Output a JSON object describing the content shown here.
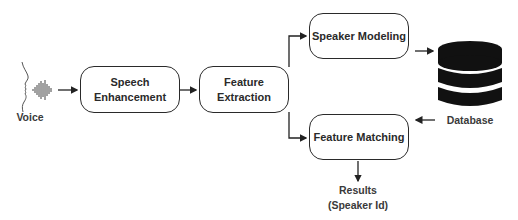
{
  "diagram": {
    "type": "flowchart",
    "title": "",
    "input": {
      "label": "Voice",
      "icon": "face-profile-voice-wave-icon"
    },
    "nodes": [
      {
        "id": "speech_enhancement",
        "label_line1": "Speech",
        "label_line2": "Enhancement"
      },
      {
        "id": "feature_extraction",
        "label_line1": "Feature",
        "label_line2": "Extraction"
      },
      {
        "id": "speaker_modeling",
        "label": "Speaker Modeling"
      },
      {
        "id": "feature_matching",
        "label": "Feature Matching"
      }
    ],
    "database": {
      "label": "Database",
      "icon": "database-icon"
    },
    "output": {
      "label_line1": "Results",
      "label_line2": "(Speaker Id)"
    },
    "edges": [
      {
        "from": "voice",
        "to": "speech_enhancement"
      },
      {
        "from": "speech_enhancement",
        "to": "feature_extraction"
      },
      {
        "from": "feature_extraction",
        "to": "speaker_modeling"
      },
      {
        "from": "feature_extraction",
        "to": "feature_matching"
      },
      {
        "from": "speaker_modeling",
        "to": "database"
      },
      {
        "from": "database",
        "to": "feature_matching"
      },
      {
        "from": "feature_matching",
        "to": "results"
      }
    ],
    "colors": {
      "stroke": "#2a2a2a",
      "database_fill": "#111111",
      "background": "#ffffff"
    }
  }
}
